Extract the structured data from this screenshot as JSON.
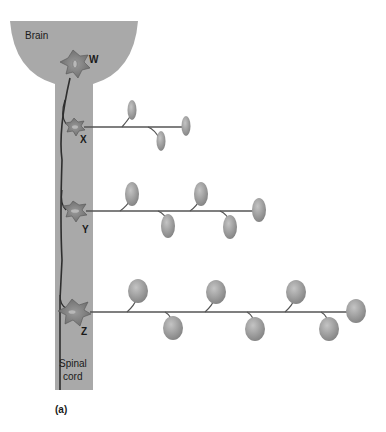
{
  "diagram": {
    "regions": {
      "brain": "Brain",
      "spinal_cord_line1": "Spinal",
      "spinal_cord_line2": "cord"
    },
    "neurons": {
      "w": "W",
      "x": "X",
      "y": "Y",
      "z": "Z"
    },
    "panel_label": "(a)",
    "colors": {
      "tissue": "#a8a8a8",
      "neuron_body": "#7a7a7a",
      "axon": "#555555",
      "muscle_fiber": "#9a9a9a"
    },
    "motor_units": [
      {
        "neuron": "X",
        "fiber_count": 3
      },
      {
        "neuron": "Y",
        "fiber_count": 5
      },
      {
        "neuron": "Z",
        "fiber_count": 7
      }
    ]
  }
}
